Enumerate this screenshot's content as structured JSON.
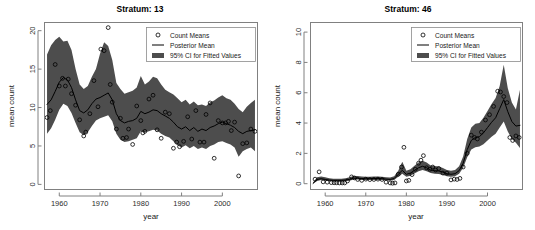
{
  "figure": {
    "background": "#ffffff",
    "band_color": "#4d4d4d",
    "line_color": "#000000",
    "point_color": "#000000",
    "axis_color": "#808080"
  },
  "legend": {
    "items": [
      {
        "label": "Count Means",
        "marker": "circle-open-icon"
      },
      {
        "label": "Posterior Mean",
        "marker": "line-icon"
      },
      {
        "label": "95% CI for Fitted Values",
        "marker": "filled-band-icon"
      }
    ]
  },
  "chart_data": [
    {
      "type": "line",
      "panel": "left",
      "title": "Stratum:  13",
      "xlabel": "year",
      "ylabel": "mean count",
      "xlim": [
        1956.5,
        2008.5
      ],
      "ylim": [
        -0.6,
        21.0
      ],
      "xticks": [
        1960,
        1970,
        1980,
        1990,
        2000
      ],
      "yticks": [
        0,
        5,
        10,
        15,
        20
      ],
      "grid": false,
      "legend_position": "top-right",
      "series": [
        {
          "name": "Posterior Mean",
          "x": [
            1957,
            1958,
            1959,
            1960,
            1961,
            1962,
            1963,
            1964,
            1965,
            1966,
            1967,
            1968,
            1969,
            1970,
            1971,
            1972,
            1973,
            1974,
            1975,
            1976,
            1977,
            1978,
            1979,
            1980,
            1981,
            1982,
            1983,
            1984,
            1985,
            1986,
            1987,
            1988,
            1989,
            1990,
            1991,
            1992,
            1993,
            1994,
            1995,
            1996,
            1997,
            1998,
            1999,
            2000,
            2001,
            2002,
            2003,
            2004,
            2005,
            2006,
            2007,
            2008
          ],
          "values": [
            10.4,
            11.0,
            12.1,
            13.3,
            13.9,
            13.6,
            12.6,
            11.0,
            9.6,
            9.3,
            9.7,
            10.5,
            11.1,
            11.3,
            11.6,
            11.9,
            11.0,
            9.2,
            8.3,
            8.0,
            8.2,
            8.3,
            8.6,
            9.5,
            9.2,
            9.4,
            9.7,
            9.6,
            9.2,
            8.9,
            8.6,
            8.1,
            7.5,
            7.2,
            7.5,
            7.0,
            7.4,
            6.9,
            7.2,
            7.0,
            7.4,
            7.6,
            7.9,
            8.1,
            7.9,
            7.7,
            7.4,
            6.9,
            6.6,
            6.9,
            7.0,
            7.1
          ]
        },
        {
          "name": "95% CI for Fitted Values",
          "x": [
            1957,
            1958,
            1959,
            1960,
            1961,
            1962,
            1963,
            1964,
            1965,
            1966,
            1967,
            1968,
            1969,
            1970,
            1971,
            1972,
            1973,
            1974,
            1975,
            1976,
            1977,
            1978,
            1979,
            1980,
            1981,
            1982,
            1983,
            1984,
            1985,
            1986,
            1987,
            1988,
            1989,
            1990,
            1991,
            1992,
            1993,
            1994,
            1995,
            1996,
            1997,
            1998,
            1999,
            2000,
            2001,
            2002,
            2003,
            2004,
            2005,
            2006,
            2007,
            2008
          ],
          "lower": [
            6.6,
            7.3,
            8.4,
            9.7,
            10.5,
            10.2,
            9.3,
            8.0,
            6.8,
            6.4,
            6.8,
            7.6,
            8.3,
            8.6,
            8.8,
            9.0,
            8.2,
            6.6,
            5.8,
            5.5,
            5.6,
            5.8,
            6.0,
            6.9,
            6.8,
            6.9,
            7.1,
            7.0,
            6.6,
            6.3,
            6.1,
            5.6,
            5.1,
            4.8,
            5.1,
            4.7,
            5.0,
            4.6,
            4.8,
            4.6,
            5.0,
            5.2,
            5.5,
            5.6,
            5.4,
            5.2,
            4.8,
            3.6,
            4.3,
            4.6,
            4.8,
            4.3
          ],
          "upper": [
            16.9,
            18.1,
            18.8,
            19.2,
            18.6,
            18.7,
            17.5,
            15.0,
            13.0,
            12.4,
            12.8,
            14.0,
            15.0,
            17.0,
            18.5,
            18.0,
            16.2,
            13.2,
            12.4,
            11.8,
            12.0,
            12.2,
            12.6,
            14.1,
            13.0,
            13.4,
            14.0,
            13.8,
            13.0,
            12.3,
            12.0,
            11.7,
            11.2,
            10.7,
            11.0,
            10.4,
            10.8,
            10.3,
            10.4,
            10.2,
            10.7,
            10.9,
            11.3,
            11.6,
            11.2,
            11.0,
            10.5,
            9.8,
            9.4,
            10.1,
            10.6,
            11.0
          ]
        }
      ],
      "points": {
        "name": "Count Means",
        "x": [
          1957,
          1957.8,
          1959,
          1960,
          1960.8,
          1961.5,
          1962.2,
          1963,
          1964,
          1965,
          1966,
          1966.5,
          1967.5,
          1968.5,
          1969.5,
          1970.2,
          1971,
          1972,
          1972.5,
          1973,
          1974,
          1975,
          1975.6,
          1976.5,
          1977,
          1978,
          1979,
          1980,
          1980.5,
          1981,
          1982,
          1983,
          1984,
          1985,
          1986,
          1987,
          1988,
          1988.8,
          1989.5,
          1990.5,
          1991.5,
          1992.5,
          1993.5,
          1994.5,
          1995.5,
          1996,
          1997,
          1998,
          1999,
          2000,
          2000.8,
          2001.5,
          2002.2,
          2003,
          2004,
          2005,
          2006,
          2007,
          2008
        ],
        "values": [
          8.7,
          9.6,
          15.6,
          12.8,
          13.8,
          12.8,
          13.7,
          11.8,
          10.3,
          8.4,
          6.3,
          6.8,
          9.2,
          13.5,
          10.1,
          17.6,
          17.4,
          20.4,
          13.0,
          10.7,
          7.2,
          8.6,
          6.0,
          6.1,
          7.2,
          5.2,
          10.2,
          8.3,
          6.7,
          6.9,
          11.1,
          11.6,
          7.1,
          6.0,
          9.4,
          9.2,
          4.7,
          5.5,
          4.9,
          5.6,
          8.8,
          5.9,
          9.6,
          5.5,
          5.5,
          9.1,
          10.6,
          3.4,
          8.3,
          8.0,
          8.0,
          8.2,
          7.0,
          8.1,
          1.1,
          5.3,
          5.4,
          7.2,
          6.9
        ]
      }
    },
    {
      "type": "line",
      "panel": "right",
      "title": "Stratum:  46",
      "xlabel": "year",
      "ylabel": "mean count",
      "xlim": [
        1956.5,
        2008.5
      ],
      "ylim": [
        -0.35,
        10.6
      ],
      "xticks": [
        1960,
        1970,
        1980,
        1990,
        2000
      ],
      "yticks": [
        0,
        2,
        4,
        6,
        8,
        10
      ],
      "grid": false,
      "legend_position": "top-right",
      "series": [
        {
          "name": "Posterior Mean",
          "x": [
            1957,
            1958,
            1959,
            1960,
            1961,
            1962,
            1963,
            1964,
            1965,
            1966,
            1967,
            1968,
            1969,
            1970,
            1971,
            1972,
            1973,
            1974,
            1975,
            1976,
            1977,
            1978,
            1979,
            1980,
            1981,
            1982,
            1983,
            1984,
            1985,
            1986,
            1987,
            1988,
            1989,
            1990,
            1991,
            1992,
            1993,
            1994,
            1995,
            1996,
            1997,
            1998,
            1999,
            2000,
            2001,
            2002,
            2003,
            2004,
            2005,
            2006,
            2007,
            2008
          ],
          "values": [
            0.02,
            0.28,
            0.33,
            0.28,
            0.24,
            0.22,
            0.22,
            0.22,
            0.24,
            0.28,
            0.36,
            0.36,
            0.34,
            0.33,
            0.33,
            0.34,
            0.34,
            0.33,
            0.3,
            0.28,
            0.34,
            0.62,
            0.88,
            0.62,
            0.7,
            0.88,
            1.05,
            1.15,
            1.05,
            0.9,
            0.86,
            0.84,
            0.76,
            0.66,
            0.62,
            0.66,
            0.86,
            1.35,
            2.25,
            2.85,
            3.05,
            3.1,
            3.35,
            3.7,
            4.05,
            4.35,
            4.95,
            5.55,
            4.75,
            4.1,
            3.8,
            3.85
          ]
        },
        {
          "name": "95% CI for Fitted Values",
          "x": [
            1957,
            1958,
            1959,
            1960,
            1961,
            1962,
            1963,
            1964,
            1965,
            1966,
            1967,
            1968,
            1969,
            1970,
            1971,
            1972,
            1973,
            1974,
            1975,
            1976,
            1977,
            1978,
            1979,
            1980,
            1981,
            1982,
            1983,
            1984,
            1985,
            1986,
            1987,
            1988,
            1989,
            1990,
            1991,
            1992,
            1993,
            1994,
            1995,
            1996,
            1997,
            1998,
            1999,
            2000,
            2001,
            2002,
            2003,
            2004,
            2005,
            2006,
            2007,
            2008
          ],
          "lower": [
            0.0,
            0.18,
            0.24,
            0.2,
            0.17,
            0.15,
            0.15,
            0.15,
            0.17,
            0.2,
            0.27,
            0.27,
            0.25,
            0.24,
            0.24,
            0.25,
            0.25,
            0.24,
            0.21,
            0.19,
            0.24,
            0.46,
            0.66,
            0.46,
            0.52,
            0.67,
            0.82,
            0.9,
            0.82,
            0.7,
            0.66,
            0.64,
            0.57,
            0.49,
            0.46,
            0.49,
            0.65,
            1.05,
            1.75,
            2.25,
            2.4,
            2.45,
            2.6,
            2.85,
            3.1,
            3.3,
            3.7,
            4.1,
            3.45,
            2.95,
            2.7,
            2.35
          ],
          "upper": [
            0.08,
            0.42,
            0.48,
            0.42,
            0.36,
            0.33,
            0.33,
            0.33,
            0.36,
            0.42,
            0.5,
            0.5,
            0.48,
            0.46,
            0.46,
            0.48,
            0.48,
            0.46,
            0.43,
            0.41,
            0.49,
            0.86,
            1.45,
            0.86,
            0.95,
            1.18,
            1.4,
            1.52,
            1.4,
            1.2,
            1.16,
            1.14,
            1.03,
            0.9,
            0.85,
            0.9,
            1.15,
            1.8,
            2.95,
            3.7,
            3.95,
            4.0,
            4.35,
            4.8,
            5.25,
            5.65,
            6.45,
            7.85,
            6.3,
            5.35,
            4.9,
            6.2
          ]
        }
      ],
      "points": {
        "name": "Count Means",
        "x": [
          1957.5,
          1958.5,
          1959.5,
          1960.5,
          1961.5,
          1962.2,
          1962.8,
          1963.5,
          1964.2,
          1964.8,
          1965.5,
          1966.5,
          1967.2,
          1968,
          1969,
          1970,
          1971,
          1972,
          1973,
          1974,
          1975,
          1976,
          1976.6,
          1977.2,
          1978,
          1978.8,
          1979.4,
          1980,
          1980.6,
          1981.4,
          1982.2,
          1983,
          1983.6,
          1984.2,
          1985,
          1985.8,
          1986.5,
          1987.2,
          1988,
          1989,
          1990,
          1991,
          1991.8,
          1992.5,
          1993.2,
          1994,
          1995,
          1996,
          1996.8,
          1997.5,
          1998.5,
          1999.5,
          2000.5,
          2001.5,
          2002.5,
          2003.2,
          2004,
          2004.8,
          2005.5,
          2006.2,
          2007,
          2007.8
        ],
        "values": [
          0.3,
          0.78,
          0.12,
          0.1,
          0.07,
          0.06,
          0.06,
          0.05,
          0.05,
          0.05,
          0.18,
          0.45,
          0.38,
          0.28,
          0.22,
          0.3,
          0.27,
          0.28,
          0.3,
          0.28,
          0.1,
          0.05,
          0.03,
          0.05,
          0.62,
          1.1,
          2.4,
          0.18,
          0.22,
          0.6,
          0.95,
          1.35,
          1.55,
          1.85,
          1.05,
          0.95,
          1.1,
          0.9,
          1.0,
          0.7,
          0.7,
          0.25,
          0.3,
          0.28,
          0.35,
          1.1,
          2.0,
          3.2,
          3.05,
          2.95,
          3.4,
          4.2,
          4.55,
          5.1,
          6.1,
          6.05,
          5.75,
          5.35,
          3.05,
          2.85,
          3.15,
          3.05
        ]
      }
    }
  ]
}
